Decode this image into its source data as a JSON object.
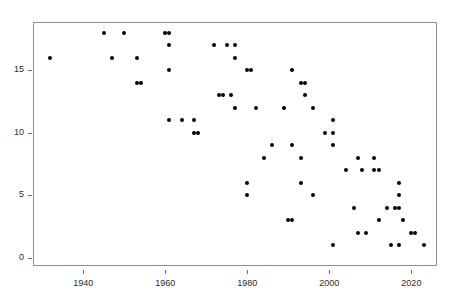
{
  "chart_data": {
    "type": "scatter",
    "title": "",
    "xlabel": "",
    "ylabel": "",
    "xlim": [
      1928,
      2026
    ],
    "ylim": [
      -0.6,
      18.8
    ],
    "grid": false,
    "legend": null,
    "marker": {
      "shape": "circle",
      "color": "#000000",
      "size": 4
    },
    "xticks": [
      1940,
      1960,
      1980,
      2000,
      2020
    ],
    "xtick_labels": [
      "1940",
      "1960",
      "1980",
      "2000",
      "2020"
    ],
    "yticks": [
      0,
      5,
      10,
      15
    ],
    "ytick_labels": [
      "0",
      "5",
      "10",
      "15"
    ],
    "points": [
      {
        "x": 1932,
        "y": 16
      },
      {
        "x": 1945,
        "y": 18
      },
      {
        "x": 1947,
        "y": 16
      },
      {
        "x": 1950,
        "y": 18
      },
      {
        "x": 1953,
        "y": 16
      },
      {
        "x": 1953,
        "y": 14
      },
      {
        "x": 1954,
        "y": 14
      },
      {
        "x": 1960,
        "y": 18
      },
      {
        "x": 1961,
        "y": 18
      },
      {
        "x": 1961,
        "y": 17
      },
      {
        "x": 1961,
        "y": 15
      },
      {
        "x": 1961,
        "y": 11
      },
      {
        "x": 1964,
        "y": 11
      },
      {
        "x": 1967,
        "y": 11
      },
      {
        "x": 1967,
        "y": 10
      },
      {
        "x": 1968,
        "y": 10
      },
      {
        "x": 1972,
        "y": 17
      },
      {
        "x": 1973,
        "y": 13
      },
      {
        "x": 1974,
        "y": 13
      },
      {
        "x": 1975,
        "y": 17
      },
      {
        "x": 1976,
        "y": 13
      },
      {
        "x": 1977,
        "y": 17
      },
      {
        "x": 1977,
        "y": 16
      },
      {
        "x": 1977,
        "y": 12
      },
      {
        "x": 1980,
        "y": 15
      },
      {
        "x": 1980,
        "y": 6
      },
      {
        "x": 1980,
        "y": 5
      },
      {
        "x": 1981,
        "y": 15
      },
      {
        "x": 1982,
        "y": 12
      },
      {
        "x": 1984,
        "y": 8
      },
      {
        "x": 1986,
        "y": 9
      },
      {
        "x": 1989,
        "y": 12
      },
      {
        "x": 1990,
        "y": 3
      },
      {
        "x": 1991,
        "y": 3
      },
      {
        "x": 1991,
        "y": 15
      },
      {
        "x": 1991,
        "y": 9
      },
      {
        "x": 1993,
        "y": 14
      },
      {
        "x": 1994,
        "y": 14
      },
      {
        "x": 1993,
        "y": 8
      },
      {
        "x": 1993,
        "y": 6
      },
      {
        "x": 1994,
        "y": 13
      },
      {
        "x": 1996,
        "y": 12
      },
      {
        "x": 1996,
        "y": 5
      },
      {
        "x": 1999,
        "y": 10
      },
      {
        "x": 2001,
        "y": 11
      },
      {
        "x": 2001,
        "y": 10
      },
      {
        "x": 2001,
        "y": 9
      },
      {
        "x": 2001,
        "y": 1
      },
      {
        "x": 2004,
        "y": 7
      },
      {
        "x": 2006,
        "y": 4
      },
      {
        "x": 2007,
        "y": 8
      },
      {
        "x": 2007,
        "y": 2
      },
      {
        "x": 2008,
        "y": 7
      },
      {
        "x": 2009,
        "y": 2
      },
      {
        "x": 2011,
        "y": 8
      },
      {
        "x": 2011,
        "y": 7
      },
      {
        "x": 2012,
        "y": 7
      },
      {
        "x": 2012,
        "y": 3
      },
      {
        "x": 2014,
        "y": 4
      },
      {
        "x": 2015,
        "y": 1
      },
      {
        "x": 2016,
        "y": 4
      },
      {
        "x": 2017,
        "y": 4
      },
      {
        "x": 2017,
        "y": 1
      },
      {
        "x": 2017,
        "y": 6
      },
      {
        "x": 2017,
        "y": 5
      },
      {
        "x": 2018,
        "y": 3
      },
      {
        "x": 2020,
        "y": 2
      },
      {
        "x": 2021,
        "y": 2
      },
      {
        "x": 2023,
        "y": 1
      }
    ]
  }
}
